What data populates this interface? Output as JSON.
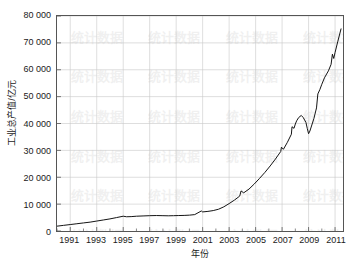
{
  "chart_data": {
    "type": "line",
    "title": "",
    "xlabel": "年份",
    "ylabel": "工业总产值/亿元",
    "xlim": [
      1990.0,
      2011.6
    ],
    "ylim": [
      0,
      80000
    ],
    "grid": true,
    "legend": null,
    "y_tick_labels": [
      "80 000",
      "70 000",
      "60 000",
      "50 000",
      "40 000",
      "30 000",
      "20 000",
      "10 000",
      "0"
    ],
    "y_tick_values": [
      80000,
      70000,
      60000,
      50000,
      40000,
      30000,
      20000,
      10000,
      0
    ],
    "x_tick_labels": [
      "1991",
      "1993",
      "1995",
      "1997",
      "1999",
      "2001",
      "2003",
      "2005",
      "2007",
      "2009",
      "2011"
    ],
    "x_tick_values": [
      1991,
      1993,
      1995,
      1997,
      1999,
      2001,
      2003,
      2005,
      2007,
      2009,
      2011
    ],
    "x_minor_step": 1,
    "line_color": "#111111",
    "grid_color": "#c8c8c8",
    "axis_color": "#555555",
    "watermark_text": "统计数据",
    "series": [
      {
        "name": "工业总产值",
        "x": [
          1990.0,
          1990.5,
          1991.0,
          1991.5,
          1992.0,
          1992.5,
          1993.0,
          1993.5,
          1994.0,
          1994.5,
          1995.0,
          1995.25,
          1995.6,
          1996.0,
          1996.5,
          1997.0,
          1997.5,
          1998.0,
          1998.4,
          1998.8,
          1999.2,
          1999.6,
          2000.0,
          2000.4,
          2000.9,
          2001.0,
          2001.4,
          2001.8,
          2002.2,
          2002.6,
          2003.0,
          2003.4,
          2003.8,
          2003.9,
          2004.1,
          2004.5,
          2004.9,
          2005.3,
          2005.7,
          2006.1,
          2006.5,
          2006.9,
          2006.95,
          2007.1,
          2007.4,
          2007.7,
          2007.75,
          2007.9,
          2008.0,
          2008.1,
          2008.25,
          2008.45,
          2008.6,
          2008.8,
          2008.9,
          2009.0,
          2009.1,
          2009.4,
          2009.6,
          2009.7,
          2009.85,
          2010.0,
          2010.2,
          2010.5,
          2010.7,
          2010.8,
          2010.9,
          2011.0,
          2011.2,
          2011.45
        ],
        "y": [
          1800,
          2100,
          2400,
          2700,
          3000,
          3300,
          3700,
          4100,
          4500,
          5000,
          5500,
          5300,
          5350,
          5500,
          5600,
          5700,
          5750,
          5700,
          5650,
          5700,
          5750,
          5800,
          5900,
          6100,
          7450,
          7100,
          7300,
          7600,
          8100,
          9000,
          10200,
          11500,
          13000,
          14900,
          14200,
          15600,
          17500,
          19600,
          21800,
          24200,
          26800,
          29600,
          31200,
          30400,
          33000,
          36000,
          38800,
          38200,
          39800,
          41000,
          42200,
          43000,
          42200,
          40400,
          38200,
          36200,
          37200,
          41800,
          45800,
          51000,
          52600,
          54600,
          57000,
          59600,
          62000,
          65800,
          64200,
          66400,
          70400,
          75200
        ]
      }
    ]
  },
  "axes": {
    "ylabel": "工业总产值/亿元",
    "xlabel": "年份"
  }
}
